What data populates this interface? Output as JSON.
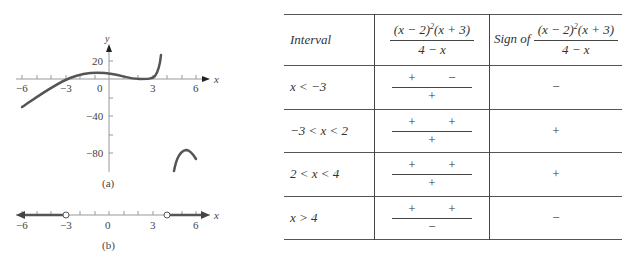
{
  "figure_a": {
    "caption": "(a)",
    "x_axis_label": "x",
    "y_axis_label": "y",
    "x_ticks": [
      "−6",
      "−3",
      "0",
      "3",
      "6"
    ],
    "y_ticks": [
      "20",
      "−40",
      "−80"
    ]
  },
  "figure_b": {
    "caption": "(b)",
    "x_axis_label": "x",
    "x_ticks": [
      "−6",
      "−3",
      "0",
      "3",
      "6"
    ],
    "open_points": [
      -3,
      4
    ]
  },
  "table": {
    "header": {
      "interval": "Interval",
      "expr_num_a": "(x − 2)",
      "expr_exp": "2",
      "expr_num_b": "(x + 3)",
      "expr_den": "4 − x",
      "sign_of": "Sign of"
    },
    "rows": [
      {
        "interval": "x < −3",
        "num1": "+",
        "num2": "−",
        "den": "+",
        "sign": "−"
      },
      {
        "interval": "−3 < x < 2",
        "num1": "+",
        "num2": "+",
        "den": "+",
        "sign": "+"
      },
      {
        "interval": "2 < x < 4",
        "num1": "+",
        "num2": "+",
        "den": "+",
        "sign": "+"
      },
      {
        "interval": "x > 4",
        "num1": "+",
        "num2": "+",
        "den": "−",
        "sign": "−"
      }
    ]
  }
}
